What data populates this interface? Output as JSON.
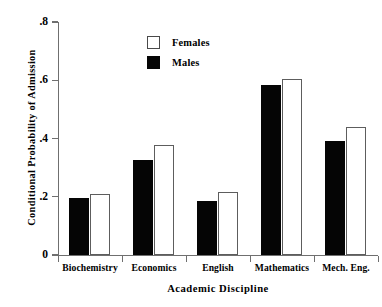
{
  "chart_data": {
    "type": "bar",
    "title": "",
    "subtitle": "",
    "xlabel": "Academic Discipline",
    "ylabel": "Conditional Probability of Admission",
    "categories": [
      "Biochemistry",
      "Economics",
      "English",
      "Mathematics",
      "Mech. Eng."
    ],
    "series": [
      {
        "name": "Males",
        "values": [
          0.197,
          0.325,
          0.185,
          0.583,
          0.39
        ],
        "color": "#050505",
        "fill": "solid-black"
      },
      {
        "name": "Females",
        "values": [
          0.208,
          0.377,
          0.215,
          0.603,
          0.44
        ],
        "color": "#ffffff",
        "fill": "white-outline"
      }
    ],
    "series_order_in_group": [
      "Males",
      "Females"
    ],
    "ylim": [
      0,
      0.8
    ],
    "ytick_values": [
      0,
      0.2,
      0.4,
      0.6,
      0.8
    ],
    "ytick_labels": [
      "0",
      ".2",
      ".4",
      ".6",
      ".8"
    ],
    "grid": false,
    "legend_position": "top-center",
    "legend_entries": [
      "Females",
      "Males"
    ],
    "annotations": []
  },
  "axes": {
    "y_title": "Conditional Probability of Admission",
    "x_title": "Academic Discipline"
  },
  "legend": {
    "items": [
      {
        "label": "Females",
        "swatch": "white-square"
      },
      {
        "label": "Males",
        "swatch": "black-square"
      }
    ]
  },
  "ticks": {
    "y": [
      {
        "label": ".8",
        "value": 0.8
      },
      {
        "label": ".6",
        "value": 0.6
      },
      {
        "label": ".4",
        "value": 0.4
      },
      {
        "label": ".2",
        "value": 0.2
      },
      {
        "label": "0",
        "value": 0.0
      }
    ]
  }
}
